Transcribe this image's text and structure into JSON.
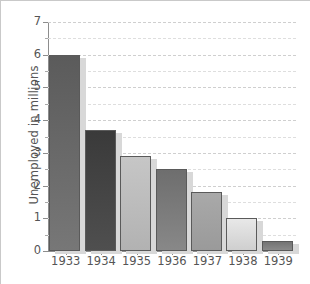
{
  "chart_data": {
    "type": "bar",
    "title": "",
    "xlabel": "",
    "ylabel": "Unemployed in millions",
    "categories": [
      "1933",
      "1934",
      "1935",
      "1936",
      "1937",
      "1938",
      "1939"
    ],
    "values": [
      6.0,
      3.7,
      2.9,
      2.5,
      1.8,
      1.0,
      0.3
    ],
    "ylim": [
      0,
      7
    ],
    "ytick_labels": [
      "0",
      "1",
      "2",
      "3",
      "4",
      "5",
      "6",
      "7"
    ],
    "ytick_values": [
      0,
      1,
      2,
      3,
      4,
      5,
      6,
      7
    ],
    "minor_tick_step": 0.5,
    "grid": true,
    "grid_style": "dashed",
    "grid_axis": "y",
    "legend": false,
    "bar_colors": [
      "#5b5b5b",
      "#3a3a3a",
      "#c6c6c6",
      "#6e6e6e",
      "#a9a9a9",
      "#e8e8e8",
      "#747474"
    ],
    "bar_colors_bottom": [
      "#777777",
      "#4f4f4f",
      "#b2b2b2",
      "#888888",
      "#9a9a9a",
      "#cfcfcf",
      "#8a8a8a"
    ],
    "bar_edge_color": "#5a5a5a",
    "shadow_color": "#d8d8d8",
    "background_color": "#ffffff",
    "axis_color": "#8d8d8d",
    "text_color": "#555555"
  },
  "caption": ""
}
